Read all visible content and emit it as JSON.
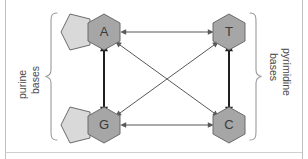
{
  "figure": {
    "background_color": "#ffffff",
    "labels": {
      "left_group": "purine bases",
      "left_group_line1": "purine",
      "left_group_line2": "bases",
      "right_group": "pyrimidine bases",
      "right_group_line1": "pyrimidine",
      "right_group_line2": "bases"
    },
    "nodes": [
      {
        "id": "A",
        "label": "A",
        "name": "adenine",
        "class": "purine",
        "shape": "bicyclic-pentagon-hexagon",
        "cx": 104,
        "cy": 32,
        "hex_fill": "#a6a6a6",
        "pent_fill": "#d9d9d9",
        "stroke": "#6b6b6b"
      },
      {
        "id": "T",
        "label": "T",
        "name": "thymine",
        "class": "pyrimidine",
        "shape": "hexagon",
        "cx": 229,
        "cy": 32,
        "hex_fill": "#a6a6a6",
        "pent_fill": "#d9d9d9",
        "stroke": "#6b6b6b"
      },
      {
        "id": "G",
        "label": "G",
        "name": "guanine",
        "class": "purine",
        "shape": "bicyclic-pentagon-hexagon",
        "cx": 104,
        "cy": 125,
        "hex_fill": "#a6a6a6",
        "pent_fill": "#d9d9d9",
        "stroke": "#6b6b6b"
      },
      {
        "id": "C",
        "label": "C",
        "name": "cytosine",
        "class": "pyrimidine",
        "shape": "hexagon",
        "cx": 229,
        "cy": 125,
        "hex_fill": "#a6a6a6",
        "pent_fill": "#d9d9d9",
        "stroke": "#6b6b6b"
      }
    ],
    "edges": [
      {
        "id": "A-T",
        "from": "A",
        "to": "T",
        "kind": "double-headed-arrow",
        "weight": "thin",
        "color": "#585858"
      },
      {
        "id": "G-C",
        "from": "G",
        "to": "C",
        "kind": "double-headed-arrow",
        "weight": "thin",
        "color": "#585858"
      },
      {
        "id": "A-G",
        "from": "A",
        "to": "G",
        "kind": "double-headed-arrow",
        "weight": "thick",
        "color": "#1f1f1f"
      },
      {
        "id": "T-C",
        "from": "T",
        "to": "C",
        "kind": "double-headed-arrow",
        "weight": "thick",
        "color": "#1f1f1f"
      },
      {
        "id": "A-C",
        "from": "A",
        "to": "C",
        "kind": "double-headed-arrow",
        "weight": "thin",
        "color": "#585858"
      },
      {
        "id": "G-T",
        "from": "G",
        "to": "T",
        "kind": "double-headed-arrow",
        "weight": "thin",
        "color": "#585858"
      }
    ],
    "braces": [
      {
        "id": "left-brace",
        "side": "left",
        "color": "#9a9a9a"
      },
      {
        "id": "right-brace",
        "side": "right",
        "color": "#9a9a9a"
      }
    ],
    "colors": {
      "hexagon_fill": "#a6a6a6",
      "pentagon_fill": "#d9d9d9",
      "node_stroke": "#6b6b6b",
      "thin_arrow": "#585858",
      "thick_arrow": "#1f1f1f",
      "brace": "#9a9a9a",
      "page_rule": "#bfbfbf",
      "letter": "#3a3a3a",
      "label_text": "#4a4a4a"
    }
  }
}
